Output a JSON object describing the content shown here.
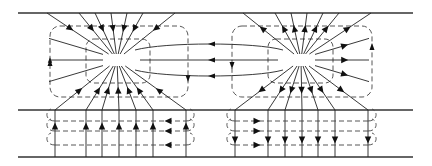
{
  "diagram": {
    "type": "field-line diagram",
    "colors": {
      "line": "#222222",
      "background": "#ffffff"
    },
    "plates_y": [
      13,
      110,
      157
    ],
    "plate_x_range": [
      18,
      413
    ],
    "left_pole": {
      "cx": 117,
      "cy": 60,
      "role": "sink",
      "arrow_direction": "inward"
    },
    "right_pole": {
      "cx": 301,
      "cy": 60,
      "role": "source",
      "arrow_direction": "outward"
    },
    "left_boxes": {
      "outer": [
        50,
        26,
        188,
        97
      ],
      "inner": [
        86,
        39,
        150,
        83
      ]
    },
    "right_boxes": {
      "outer": [
        232,
        26,
        372,
        97
      ],
      "inner": [
        268,
        39,
        333,
        83
      ]
    },
    "bottom_left_verticals_x": [
      55,
      86,
      102,
      119,
      136,
      153,
      186
    ],
    "bottom_right_verticals_x": [
      235,
      268,
      285,
      302,
      318,
      335,
      368
    ],
    "bottom_dashed_y": [
      121,
      131,
      145
    ],
    "bottom_left_direction": "up",
    "bottom_right_direction": "down",
    "connecting_lines_direction": "right-to-left"
  }
}
